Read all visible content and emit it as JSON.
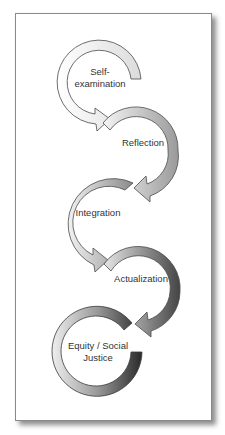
{
  "diagram": {
    "type": "cyclic-process-flow",
    "steps": [
      {
        "label_line1": "Self-",
        "label_line2": "examination",
        "shade": "#e6e6e6"
      },
      {
        "label_line1": "Reflection",
        "shade": "#a8a8a8"
      },
      {
        "label_line1": "Integration",
        "shade": "#9a9a9a"
      },
      {
        "label_line1": "Actualization",
        "shade": "#5a5a5a"
      },
      {
        "label_line1": "Equity / Social",
        "label_line2": "Justice",
        "shade": "#3a3a3a"
      }
    ],
    "colors": {
      "border": "#8a8a8a",
      "arrow_stroke": "#4a4a4a",
      "text": "#333333"
    }
  }
}
